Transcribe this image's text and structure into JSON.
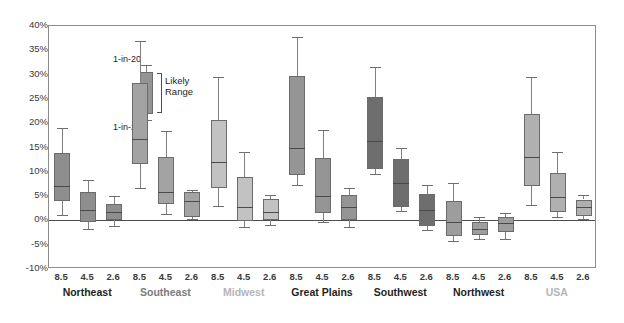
{
  "chart_data": {
    "type": "box",
    "title": "",
    "xlabel": "",
    "ylabel": "",
    "ylim": [
      -10,
      40
    ],
    "ytick_labels": [
      "40%",
      "35%",
      "30%",
      "25%",
      "20%",
      "15%",
      "10%",
      "5%",
      "0%",
      "-5%",
      "-10%"
    ],
    "ytick_values": [
      40,
      35,
      30,
      25,
      20,
      15,
      10,
      5,
      0,
      -5,
      -10
    ],
    "grid": false,
    "zero_line": true,
    "scenario_labels": [
      "8.5",
      "4.5",
      "2.6"
    ],
    "legend": {
      "upper_label": "1-in-20",
      "lower_label": "1-in-20",
      "range_label": "Likely\nRange",
      "range_label_line1": "Likely",
      "range_label_line2": "Range"
    },
    "groups": [
      {
        "name": "Northeast",
        "label_color": "#231f20",
        "box_color": "#8e8e8e",
        "boxes": [
          {
            "scenario": "8.5",
            "low_1in20": 1.2,
            "q1": 4.0,
            "median": 7.0,
            "q3": 13.8,
            "high_1in20": 19.0
          },
          {
            "scenario": "4.5",
            "low_1in20": -1.8,
            "q1": -0.3,
            "median": 2.2,
            "q3": 5.9,
            "high_1in20": 8.3
          },
          {
            "scenario": "2.6",
            "low_1in20": -1.2,
            "q1": 0.0,
            "median": 1.8,
            "q3": 3.4,
            "high_1in20": 5.0
          }
        ]
      },
      {
        "name": "Southeast",
        "label_color": "#7b7b7b",
        "box_color": "#a3a3a3",
        "boxes": [
          {
            "scenario": "8.5",
            "low_1in20": 6.6,
            "q1": 11.6,
            "median": 16.8,
            "q3": 28.3,
            "high_1in20": 37.0
          },
          {
            "scenario": "4.5",
            "low_1in20": 1.4,
            "q1": 3.4,
            "median": 5.8,
            "q3": 13.0,
            "high_1in20": 18.3
          },
          {
            "scenario": "2.6",
            "low_1in20": 0.3,
            "q1": 0.8,
            "median": 3.9,
            "q3": 5.9,
            "high_1in20": 6.2
          }
        ]
      },
      {
        "name": "Midwest",
        "label_color": "#b5b5b5",
        "box_color": "#c2c2c2",
        "boxes": [
          {
            "scenario": "8.5",
            "low_1in20": 3.0,
            "q1": 6.6,
            "median": 12.0,
            "q3": 20.7,
            "high_1in20": 29.5
          },
          {
            "scenario": "4.5",
            "low_1in20": -1.3,
            "q1": -0.2,
            "median": 2.7,
            "q3": 9.0,
            "high_1in20": 14.0
          },
          {
            "scenario": "2.6",
            "low_1in20": -0.9,
            "q1": 0.0,
            "median": 1.7,
            "q3": 4.4,
            "high_1in20": 5.3
          }
        ]
      },
      {
        "name": "Great Plains",
        "label_color": "#231f20",
        "box_color": "#959595",
        "boxes": [
          {
            "scenario": "8.5",
            "low_1in20": 7.2,
            "q1": 9.3,
            "median": 14.9,
            "q3": 29.8,
            "high_1in20": 37.8
          },
          {
            "scenario": "4.5",
            "low_1in20": -0.4,
            "q1": 1.6,
            "median": 5.1,
            "q3": 12.8,
            "high_1in20": 18.6
          },
          {
            "scenario": "2.6",
            "low_1in20": -1.3,
            "q1": 0.1,
            "median": 2.7,
            "q3": 5.3,
            "high_1in20": 6.6
          }
        ]
      },
      {
        "name": "Southwest",
        "label_color": "#231f20",
        "box_color": "#6e6e6e",
        "boxes": [
          {
            "scenario": "8.5",
            "low_1in20": 9.6,
            "q1": 10.6,
            "median": 16.4,
            "q3": 25.3,
            "high_1in20": 31.5
          },
          {
            "scenario": "4.5",
            "low_1in20": 1.9,
            "q1": 2.7,
            "median": 7.6,
            "q3": 12.6,
            "high_1in20": 15.0
          },
          {
            "scenario": "2.6",
            "low_1in20": -1.9,
            "q1": -1.2,
            "median": 2.1,
            "q3": 5.4,
            "high_1in20": 7.3
          }
        ]
      },
      {
        "name": "Northwest",
        "label_color": "#231f20",
        "box_color": "#9d9d9d",
        "boxes": [
          {
            "scenario": "8.5",
            "low_1in20": -4.3,
            "q1": -3.2,
            "median": -0.3,
            "q3": 4.0,
            "high_1in20": 7.6
          },
          {
            "scenario": "4.5",
            "low_1in20": -3.8,
            "q1": -3.1,
            "median": -1.8,
            "q3": -0.4,
            "high_1in20": 0.6
          },
          {
            "scenario": "2.6",
            "low_1in20": -3.9,
            "q1": -2.3,
            "median": -0.5,
            "q3": 0.6,
            "high_1in20": 1.5
          }
        ]
      },
      {
        "name": "USA",
        "label_color": "#b5b5b5",
        "box_color": "#b0b0b0",
        "boxes": [
          {
            "scenario": "8.5",
            "low_1in20": 3.1,
            "q1": 7.0,
            "median": 13.0,
            "q3": 21.8,
            "high_1in20": 29.6
          },
          {
            "scenario": "4.5",
            "low_1in20": 0.6,
            "q1": 1.7,
            "median": 4.9,
            "q3": 9.7,
            "high_1in20": 14.0
          },
          {
            "scenario": "2.6",
            "low_1in20": 0.2,
            "q1": 0.9,
            "median": 2.7,
            "q3": 4.3,
            "high_1in20": 5.2
          }
        ]
      }
    ]
  }
}
